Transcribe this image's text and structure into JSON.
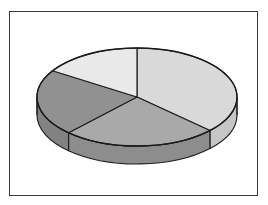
{
  "figure": {
    "kind": "3d-pie-chart",
    "background_color": "#ffffff",
    "frame": {
      "visible": true,
      "border_color": "#3a3a3a",
      "x": 9,
      "y": 11,
      "width": 249,
      "height": 185
    },
    "title": "",
    "legend": {
      "visible": false,
      "entries": []
    },
    "labels_visible": false
  },
  "geometry": {
    "center_x": 137,
    "center_y": 97,
    "radius_x": 100,
    "radius_y": 49,
    "depth": 18,
    "start_angle_deg": 90,
    "direction": "clockwise"
  },
  "chart_data": {
    "type": "pie",
    "title": "",
    "xlabel": "",
    "ylabel": "",
    "labels": [
      "Slice 1",
      "Slice 2",
      "Slice 3",
      "Slice 4"
    ],
    "values": [
      37,
      25,
      22,
      16
    ],
    "percentages": [
      37,
      25,
      22,
      16
    ],
    "colors": [
      "#d9d9d9",
      "#a9a9a9",
      "#919191",
      "#e9e9e9"
    ],
    "side_colors": [
      "#c6c6c6",
      "#8d8d8d",
      "#828282",
      "#d2d2d2"
    ],
    "exploded": false,
    "three_d": true,
    "legend_position": "none",
    "grid": false,
    "slice_boundaries_deg": [
      90,
      -45,
      182,
      152
    ],
    "slices": [
      {
        "name": "Slice 1",
        "value": 37,
        "percent": 37,
        "color": "#d9d9d9",
        "side_color": "#c6c6c6",
        "start_angle_deg": 90,
        "end_angle_deg": -45
      },
      {
        "name": "Slice 2",
        "value": 25,
        "percent": 25,
        "color": "#a9a9a9",
        "side_color": "#8d8d8d",
        "start_angle_deg": -45,
        "end_angle_deg": -178
      },
      {
        "name": "Slice 3",
        "value": 22,
        "percent": 22,
        "color": "#919191",
        "side_color": "#828282",
        "start_angle_deg": 182,
        "end_angle_deg": 152
      },
      {
        "name": "Slice 4",
        "value": 16,
        "percent": 16,
        "color": "#e9e9e9",
        "side_color": "#d2d2d2",
        "start_angle_deg": 152,
        "end_angle_deg": 90
      }
    ]
  }
}
